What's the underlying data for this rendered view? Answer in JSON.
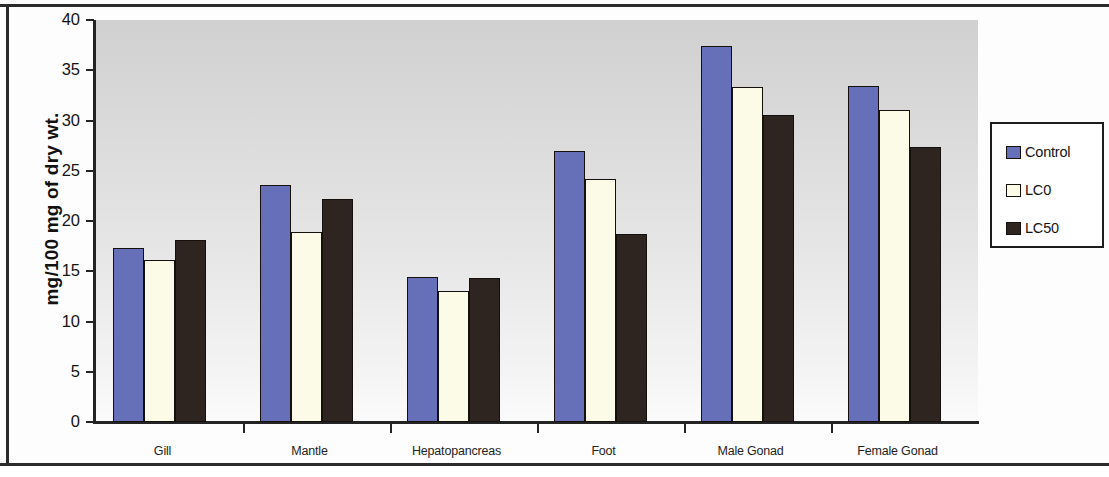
{
  "chart_data": {
    "type": "bar",
    "title": "",
    "subtitle": "",
    "xlabel": "",
    "ylabel": "mg/100 mg of dry wt.",
    "categories": [
      "Gill",
      "Mantle",
      "Hepatopancreas",
      "Foot",
      "Male Gonad",
      "Female Gonad"
    ],
    "series": [
      {
        "name": "Control",
        "color": "#6670b8",
        "values": [
          17.3,
          23.6,
          14.4,
          27.0,
          37.4,
          33.4
        ]
      },
      {
        "name": "LC0",
        "color": "#fbfbe8",
        "values": [
          16.1,
          18.9,
          13.0,
          24.2,
          33.3,
          31.0
        ]
      },
      {
        "name": "LC50",
        "color": "#2e2420",
        "values": [
          18.1,
          22.2,
          14.3,
          18.7,
          30.5,
          27.4
        ]
      }
    ],
    "ylim": [
      0,
      40
    ],
    "ytick_step": 5,
    "ytick_labels": [
      "40",
      "35",
      "30",
      "25",
      "20",
      "15",
      "10",
      "5",
      "0"
    ],
    "ytick_values": [
      40,
      35,
      30,
      25,
      20,
      15,
      10,
      5,
      0
    ],
    "grid": false,
    "legend_position": "right",
    "plot_background": "#e0e0e0"
  },
  "legend": {
    "entries": [
      {
        "label": "Control"
      },
      {
        "label": "LC0"
      },
      {
        "label": "LC50"
      }
    ]
  }
}
